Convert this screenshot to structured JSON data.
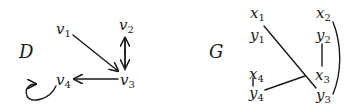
{
  "digraph": {
    "name": "D",
    "vertices": [
      {
        "id": "v1",
        "base": "v",
        "sub": "1"
      },
      {
        "id": "v2",
        "base": "v",
        "sub": "2"
      },
      {
        "id": "v3",
        "base": "v",
        "sub": "3"
      },
      {
        "id": "v4",
        "base": "v",
        "sub": "4"
      }
    ],
    "arcs": [
      {
        "from": "v1",
        "to": "v3"
      },
      {
        "from": "v2",
        "to": "v3"
      },
      {
        "from": "v3",
        "to": "v2"
      },
      {
        "from": "v3",
        "to": "v4"
      },
      {
        "from": "v4",
        "to": "v4"
      }
    ]
  },
  "graph": {
    "name": "G",
    "vertices": [
      {
        "id": "x1",
        "base": "x",
        "sub": "1"
      },
      {
        "id": "y1",
        "base": "y",
        "sub": "1"
      },
      {
        "id": "x2",
        "base": "x",
        "sub": "2"
      },
      {
        "id": "y2",
        "base": "y",
        "sub": "2"
      },
      {
        "id": "x3",
        "base": "x",
        "sub": "3"
      },
      {
        "id": "y3",
        "base": "y",
        "sub": "3"
      },
      {
        "id": "x4",
        "base": "x",
        "sub": "4"
      },
      {
        "id": "y4",
        "base": "y",
        "sub": "4"
      }
    ],
    "edges": [
      {
        "from": "x1",
        "to": "y3"
      },
      {
        "from": "x2",
        "to": "y3"
      },
      {
        "from": "y2",
        "to": "x3"
      },
      {
        "from": "x3",
        "to": "y4"
      },
      {
        "from": "x4",
        "to": "y4"
      }
    ]
  }
}
